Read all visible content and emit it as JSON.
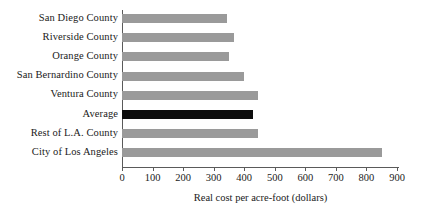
{
  "chart_data": {
    "type": "bar",
    "orientation": "horizontal",
    "title": "",
    "xlabel": "Real cost per acre-foot (dollars)",
    "ylabel": "",
    "xlim": [
      0,
      900
    ],
    "xticks": [
      0,
      100,
      200,
      300,
      400,
      500,
      600,
      700,
      800,
      900
    ],
    "xtick_labels": [
      "0",
      "100",
      "200",
      "300",
      "400",
      "500",
      "600",
      "700",
      "800",
      "900"
    ],
    "grid": false,
    "legend": "none",
    "categories": [
      "San Diego County",
      "Riverside County",
      "Orange County",
      "San Bernardino County",
      "Ventura County",
      "Average",
      "Rest of L.A. County",
      "City of Los Angeles"
    ],
    "values": [
      345,
      365,
      350,
      400,
      445,
      430,
      445,
      850
    ],
    "bar_colors": [
      "#9a9a9a",
      "#9a9a9a",
      "#9a9a9a",
      "#9a9a9a",
      "#9a9a9a",
      "#0d0d0d",
      "#9a9a9a",
      "#9a9a9a"
    ],
    "highlight_category": "Average",
    "colors": {
      "bar_default": "#9a9a9a",
      "bar_highlight": "#0d0d0d",
      "axis": "#5a5a5a",
      "text": "#1a1a1a",
      "background": "#ffffff"
    }
  }
}
